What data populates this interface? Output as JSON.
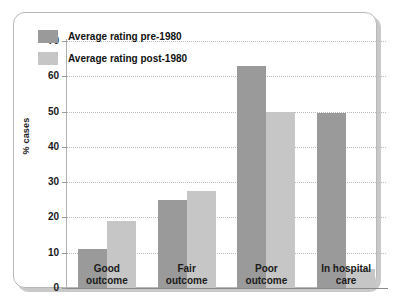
{
  "chart_data": {
    "type": "bar",
    "title": "",
    "xlabel": "",
    "ylabel": "% cases",
    "ylim": [
      0,
      70
    ],
    "ytick_step": 10,
    "ytick_labels": [
      "70",
      "60",
      "50",
      "40",
      "30",
      "20",
      "10",
      "0"
    ],
    "ytick_values": [
      70,
      60,
      50,
      40,
      30,
      20,
      10,
      0
    ],
    "grid": true,
    "legend_position": "upper-left-inside",
    "categories": [
      "Good outcome",
      "Fair outcome",
      "Poor outcome",
      "In hospital care"
    ],
    "category_lines": [
      [
        "Good",
        "outcome"
      ],
      [
        "Fair",
        "outcome"
      ],
      [
        "Poor",
        "outcome"
      ],
      [
        "In hospital",
        "care"
      ]
    ],
    "series": [
      {
        "name": "Average rating pre-1980",
        "color": "#9a9a9a",
        "values": [
          11,
          25,
          63,
          49.5
        ]
      },
      {
        "name": "Average rating post-1980",
        "color": "#c6c6c6",
        "values": [
          19,
          27.5,
          50,
          5.5
        ]
      }
    ]
  },
  "legend": {
    "items": [
      {
        "label": "Average rating pre-1980",
        "color": "#9a9a9a"
      },
      {
        "label": "Average rating post-1980",
        "color": "#c6c6c6"
      }
    ]
  },
  "colors": {
    "pre_1980": "#9a9a9a",
    "post_1980": "#c6c6c6",
    "gridline": "#bdbdbd",
    "axis": "#8a8a8a",
    "card_border": "#b8b8b8",
    "text": "#1a1a1a",
    "background": "#ffffff"
  }
}
